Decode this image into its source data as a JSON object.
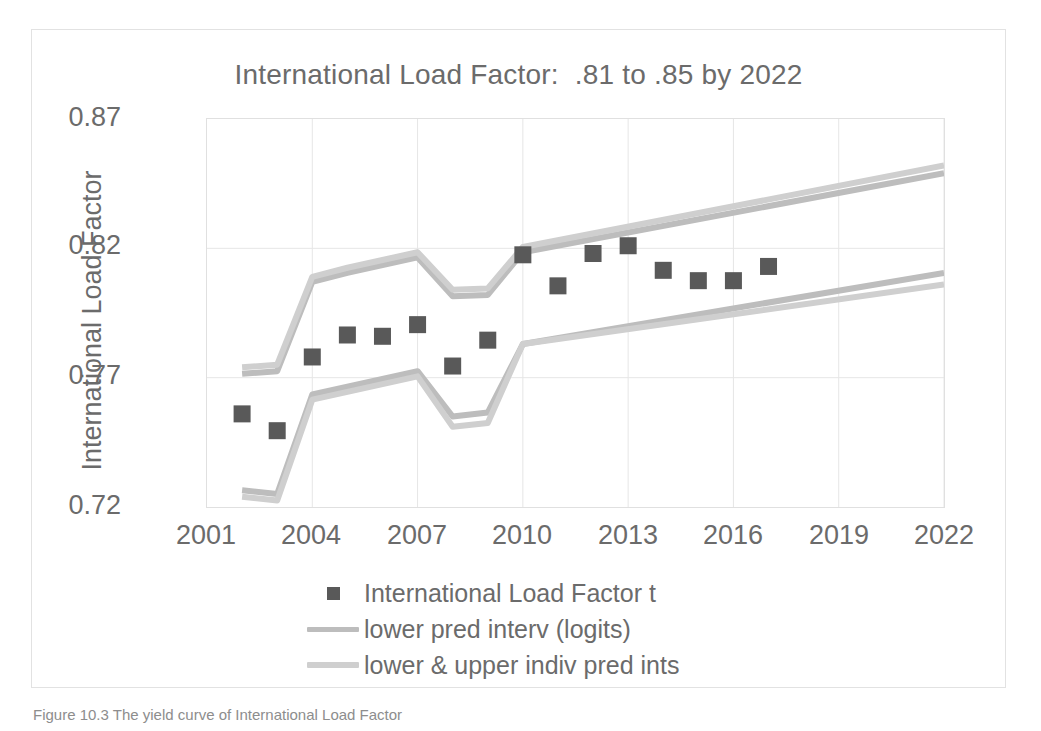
{
  "figure": {
    "caption": "Figure 10.3 The yield curve of International Load Factor"
  },
  "chart_data": {
    "type": "scatter",
    "title": "International Load Factor:  .81 to .85 by 2022",
    "xlabel": "",
    "ylabel": "International Load Factor",
    "xlim": [
      2001,
      2022
    ],
    "ylim": [
      0.72,
      0.87
    ],
    "x_ticks": [
      "2001",
      "2004",
      "2007",
      "2010",
      "2013",
      "2016",
      "2019",
      "2022"
    ],
    "x_tick_values": [
      2001,
      2004,
      2007,
      2010,
      2013,
      2016,
      2019,
      2022
    ],
    "y_ticks": [
      "0.72",
      "0.77",
      "0.82",
      "0.87"
    ],
    "y_tick_values": [
      0.72,
      0.77,
      0.82,
      0.87
    ],
    "grid": true,
    "legend_position": "bottom",
    "marker_color": "#595959",
    "line_color_logits": "#bdbdbd",
    "line_color_indiv": "#cfcfcf",
    "series": [
      {
        "name": "International Load Factor t",
        "type": "scatter",
        "marker": "square",
        "color": "#595959",
        "x": [
          2002,
          2003,
          2004,
          2005,
          2006,
          2007,
          2008,
          2009,
          2010,
          2011,
          2012,
          2013,
          2014,
          2015,
          2016,
          2017
        ],
        "values": [
          0.756,
          0.7495,
          0.778,
          0.7865,
          0.786,
          0.7905,
          0.7745,
          0.7845,
          0.8175,
          0.8055,
          0.818,
          0.821,
          0.8115,
          0.8075,
          0.8075,
          0.813
        ]
      },
      {
        "name": "lower pred interv (logits)",
        "type": "line",
        "color": "#bdbdbd",
        "x": [
          2002,
          2003,
          2004,
          2005,
          2006,
          2007,
          2008,
          2009,
          2010,
          2022
        ],
        "values": [
          0.7715,
          0.7725,
          0.807,
          0.8105,
          0.8135,
          0.8165,
          0.8015,
          0.802,
          0.8185,
          0.849
        ]
      },
      {
        "name": "upper indiv pred int",
        "type": "line",
        "color": "#cfcfcf",
        "x": [
          2002,
          2003,
          2004,
          2005,
          2006,
          2007,
          2008,
          2009,
          2010,
          2022
        ],
        "values": [
          0.774,
          0.775,
          0.809,
          0.8125,
          0.8155,
          0.8185,
          0.804,
          0.8045,
          0.8205,
          0.852
        ]
      },
      {
        "name": "lower pred interv (logits) lower",
        "type": "line",
        "color": "#bdbdbd",
        "x": [
          2002,
          2003,
          2004,
          2005,
          2006,
          2007,
          2008,
          2009,
          2010,
          2022
        ],
        "values": [
          0.7265,
          0.725,
          0.7635,
          0.7665,
          0.7695,
          0.7725,
          0.755,
          0.7565,
          0.783,
          0.8105
        ]
      },
      {
        "name": "lower indiv pred int",
        "type": "line",
        "color": "#cfcfcf",
        "x": [
          2002,
          2003,
          2004,
          2005,
          2006,
          2007,
          2008,
          2009,
          2010,
          2022
        ],
        "values": [
          0.724,
          0.7225,
          0.7615,
          0.7645,
          0.7675,
          0.7705,
          0.751,
          0.7525,
          0.783,
          0.806
        ]
      }
    ],
    "legend": [
      {
        "label": "International Load Factor t",
        "key": "marker"
      },
      {
        "label": "lower pred interv (logits)",
        "key": "line-logits"
      },
      {
        "label": "lower & upper indiv pred ints",
        "key": "line-indiv"
      }
    ]
  }
}
